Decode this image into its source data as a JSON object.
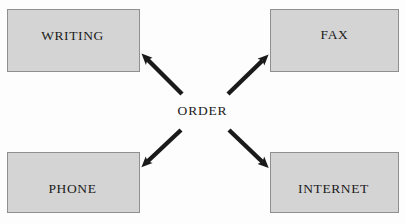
{
  "diagram": {
    "title_text": "ORDER",
    "center": {
      "label": "ORDER",
      "x": 202,
      "y": 112
    },
    "colors": {
      "background": "#fdfdfd",
      "node_fill": "#d4d4d4",
      "node_border": "#8f8f8f",
      "arrow": "#1a1a1a",
      "text": "#1b1b1b"
    },
    "nodes": [
      {
        "id": "writing",
        "label": "WRITING",
        "x": 7,
        "y": 9,
        "width": 133,
        "height": 63
      },
      {
        "id": "fax",
        "label": "FAX",
        "x": 270,
        "y": 9,
        "width": 129,
        "height": 63
      },
      {
        "id": "phone",
        "label": "PHONE",
        "x": 7,
        "y": 152,
        "width": 133,
        "height": 61
      },
      {
        "id": "internet",
        "label": "INTERNET",
        "x": 270,
        "y": 152,
        "width": 129,
        "height": 61
      }
    ],
    "arrows": [
      {
        "id": "order-to-writing",
        "from": "ORDER",
        "to": "WRITING",
        "direction": "up-left",
        "tail_x": 182,
        "tail_y": 94,
        "head_x": 143,
        "head_y": 55
      },
      {
        "id": "order-to-fax",
        "from": "ORDER",
        "to": "FAX",
        "direction": "up-right",
        "tail_x": 228,
        "tail_y": 94,
        "head_x": 267,
        "head_y": 56
      },
      {
        "id": "order-to-phone",
        "from": "ORDER",
        "to": "PHONE",
        "direction": "down-left",
        "tail_x": 181,
        "tail_y": 130,
        "head_x": 143,
        "head_y": 166
      },
      {
        "id": "order-to-internet",
        "from": "ORDER",
        "to": "INTERNET",
        "direction": "down-right",
        "tail_x": 229,
        "tail_y": 130,
        "head_x": 267,
        "head_y": 167
      }
    ]
  }
}
